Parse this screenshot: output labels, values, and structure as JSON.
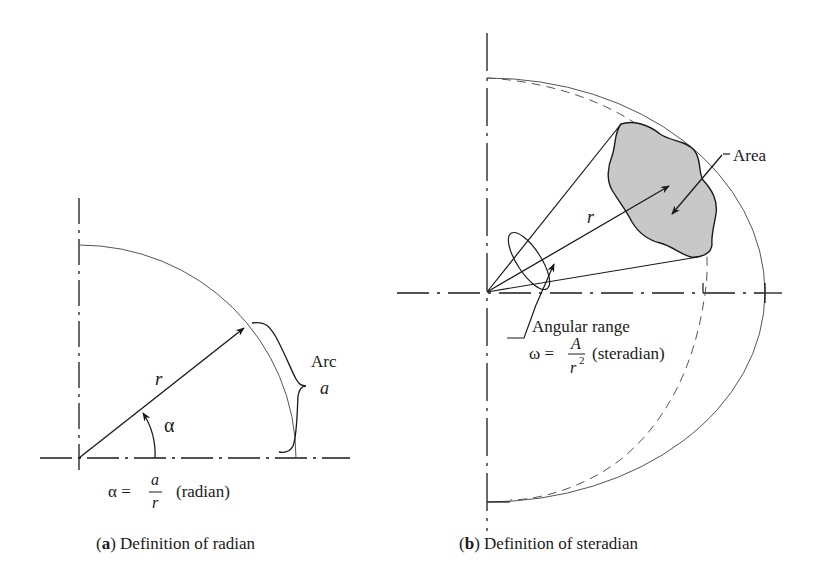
{
  "figure": {
    "panels": [
      {
        "id": "a",
        "caption_letter": "(a)",
        "caption_letter_bold": "a",
        "caption_text": " Definition of radian",
        "labels": {
          "radius": "r",
          "angle": "α",
          "arc_title": "Arc",
          "arc_symbol": "a"
        },
        "formula": {
          "lhs": "α =",
          "numerator": "a",
          "denominator": "r",
          "unit": "(radian)"
        }
      },
      {
        "id": "b",
        "caption_letter_bold": "b",
        "caption_text": " Definition of steradian",
        "labels": {
          "radius": "r",
          "area": "Area",
          "angular_range": "Angular range"
        },
        "formula": {
          "lhs": "ω =",
          "numerator": "A",
          "denominator": "r",
          "exponent": "2",
          "unit": "(steradian)"
        }
      }
    ],
    "colors": {
      "stroke": "#1a1a1a",
      "thin_stroke": "#555555",
      "area_fill": "#c8c8c8",
      "background": "#ffffff"
    }
  }
}
